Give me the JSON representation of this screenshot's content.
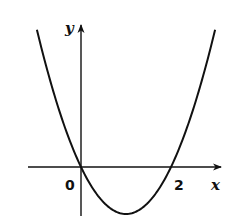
{
  "chart_data": {
    "type": "line",
    "title": "",
    "xlabel": "x",
    "ylabel": "y",
    "function": "y = x^2 - 2x",
    "origin_label": "0",
    "x_tick_labels": [
      "0",
      "2"
    ],
    "roots": [
      0,
      2
    ],
    "vertex": [
      1,
      -1
    ],
    "x": [
      -0.49,
      -0.25,
      0,
      0.25,
      0.5,
      0.75,
      1,
      1.25,
      1.5,
      1.75,
      2,
      2.25,
      2.5,
      2.75,
      2.99
    ],
    "y": [
      1.22,
      0.56,
      0,
      -0.44,
      -0.75,
      -0.94,
      -1,
      -0.94,
      -0.75,
      -0.44,
      0,
      0.56,
      1.25,
      2.06,
      2.96
    ],
    "xlim": [
      -0.6,
      1.57
    ],
    "grid": false,
    "legend": null,
    "colors": {
      "curve": "#111111",
      "axes": "#111111",
      "background": "#ffffff"
    }
  },
  "labels": {
    "y_axis": "y",
    "x_axis": "x",
    "origin": "0",
    "tick_2": "2"
  }
}
